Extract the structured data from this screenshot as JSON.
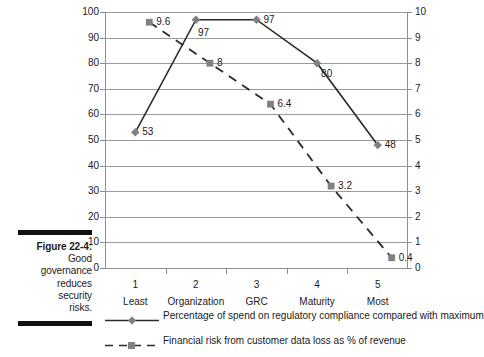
{
  "caption": {
    "lines": [
      "Figure 22-4:",
      "Good",
      "governance",
      "reduces",
      "security",
      "risks."
    ]
  },
  "chart_data": {
    "type": "line",
    "title": "",
    "xlabel": "",
    "categories": [
      "1",
      "2",
      "3",
      "4",
      "5"
    ],
    "category_sublabels": [
      "Least",
      "Organization",
      "GRC",
      "Maturity",
      "Most"
    ],
    "left_axis": {
      "label": "",
      "ylim": [
        0,
        100
      ],
      "ticks": [
        "0",
        "10",
        "20",
        "30",
        "40",
        "50",
        "60",
        "70",
        "80",
        "90",
        "100"
      ]
    },
    "right_axis": {
      "label": "",
      "ylim": [
        0,
        10
      ],
      "ticks": [
        "0",
        "1",
        "2",
        "3",
        "4",
        "5",
        "6",
        "7",
        "8",
        "9",
        "10"
      ]
    },
    "grid": true,
    "legend_position": "bottom",
    "series": [
      {
        "name": "Percentage of spend on regulatory compliance compared with maximum",
        "axis": "left",
        "marker": "diamond",
        "line_style": "solid",
        "color": "#2b2b2b",
        "marker_color": "#808080",
        "values": [
          53,
          97,
          97,
          80,
          48
        ],
        "labels": [
          "53",
          "97",
          "97",
          "80",
          "48"
        ]
      },
      {
        "name": "Financial risk from customer data loss as % of revenue",
        "axis": "right",
        "marker": "square",
        "line_style": "dashed",
        "color": "#2b2b2b",
        "marker_color": "#808080",
        "values": [
          9.6,
          8,
          6.4,
          3.2,
          0.4
        ],
        "labels": [
          "9.6",
          "8",
          "6.4",
          "3.2",
          "0.4"
        ]
      }
    ]
  },
  "colors": {
    "line": "#2b2b2b",
    "marker": "#808080",
    "grid": "#9a9a9a",
    "axis": "#8e8e8e",
    "caption_rule": "#111111"
  }
}
